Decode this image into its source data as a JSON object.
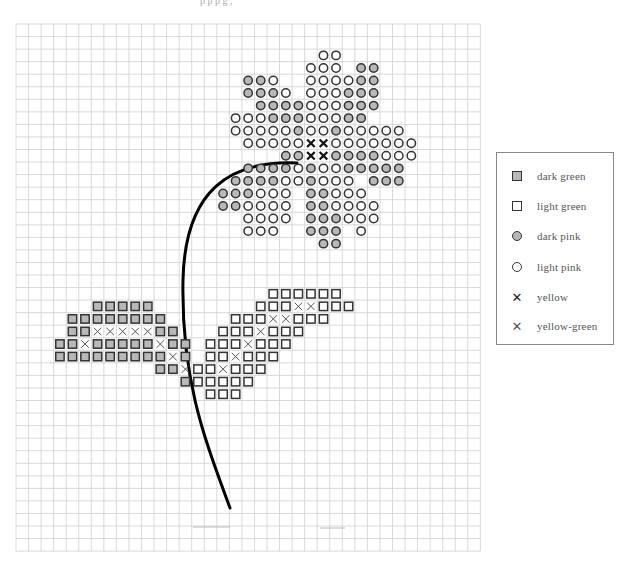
{
  "page": {
    "header_fragment": "p p p g ,"
  },
  "legend": {
    "items": [
      {
        "symbol": "square-dark",
        "label": "dark green"
      },
      {
        "symbol": "square-light",
        "label": "light green"
      },
      {
        "symbol": "circle-dark",
        "label": "dark pink"
      },
      {
        "symbol": "circle-light",
        "label": "light pink"
      },
      {
        "symbol": "x-bold",
        "label": "yellow"
      },
      {
        "symbol": "x-thin",
        "label": "yellow-green"
      }
    ]
  },
  "grid": {
    "x0": 16,
    "y0": 24,
    "cell": 12.55,
    "cols": 37,
    "rows": 42,
    "line_color": "#cfcfcf"
  },
  "colors": {
    "dark_fill": "#b8b8b8",
    "outline": "#333333",
    "stem": "#000000"
  },
  "stem": {
    "path": "M297,163 C230,160 185,190 183,280 C181,380 205,440 230,508"
  },
  "pattern": {
    "legend_codes": {
      "D": "dark pink circle",
      "L": "light pink circle",
      "Y": "yellow x",
      "G": "dark green square",
      "g": "light green square",
      "y": "yellow-green x"
    },
    "cells": [
      [
        2,
        24,
        "L"
      ],
      [
        2,
        25,
        "L"
      ],
      [
        3,
        23,
        "L"
      ],
      [
        3,
        24,
        "L"
      ],
      [
        3,
        25,
        "L"
      ],
      [
        3,
        27,
        "D"
      ],
      [
        3,
        28,
        "D"
      ],
      [
        4,
        18,
        "D"
      ],
      [
        4,
        19,
        "D"
      ],
      [
        4,
        20,
        "L"
      ],
      [
        4,
        23,
        "L"
      ],
      [
        4,
        24,
        "L"
      ],
      [
        4,
        25,
        "L"
      ],
      [
        4,
        26,
        "L"
      ],
      [
        4,
        27,
        "D"
      ],
      [
        4,
        28,
        "D"
      ],
      [
        5,
        18,
        "D"
      ],
      [
        5,
        19,
        "D"
      ],
      [
        5,
        20,
        "D"
      ],
      [
        5,
        21,
        "L"
      ],
      [
        5,
        23,
        "L"
      ],
      [
        5,
        24,
        "L"
      ],
      [
        5,
        25,
        "L"
      ],
      [
        5,
        26,
        "D"
      ],
      [
        5,
        27,
        "D"
      ],
      [
        5,
        28,
        "D"
      ],
      [
        6,
        19,
        "D"
      ],
      [
        6,
        20,
        "D"
      ],
      [
        6,
        21,
        "D"
      ],
      [
        6,
        22,
        "D"
      ],
      [
        6,
        23,
        "L"
      ],
      [
        6,
        24,
        "L"
      ],
      [
        6,
        25,
        "L"
      ],
      [
        6,
        26,
        "D"
      ],
      [
        6,
        27,
        "D"
      ],
      [
        6,
        28,
        "D"
      ],
      [
        7,
        17,
        "L"
      ],
      [
        7,
        18,
        "L"
      ],
      [
        7,
        19,
        "L"
      ],
      [
        7,
        20,
        "D"
      ],
      [
        7,
        21,
        "D"
      ],
      [
        7,
        22,
        "D"
      ],
      [
        7,
        23,
        "L"
      ],
      [
        7,
        24,
        "L"
      ],
      [
        7,
        25,
        "L"
      ],
      [
        7,
        26,
        "D"
      ],
      [
        7,
        27,
        "D"
      ],
      [
        8,
        17,
        "L"
      ],
      [
        8,
        18,
        "L"
      ],
      [
        8,
        19,
        "L"
      ],
      [
        8,
        20,
        "L"
      ],
      [
        8,
        21,
        "L"
      ],
      [
        8,
        22,
        "D"
      ],
      [
        8,
        23,
        "L"
      ],
      [
        8,
        24,
        "L"
      ],
      [
        8,
        25,
        "D"
      ],
      [
        8,
        26,
        "L"
      ],
      [
        8,
        27,
        "L"
      ],
      [
        8,
        28,
        "L"
      ],
      [
        8,
        29,
        "L"
      ],
      [
        8,
        30,
        "L"
      ],
      [
        9,
        18,
        "L"
      ],
      [
        9,
        19,
        "L"
      ],
      [
        9,
        20,
        "L"
      ],
      [
        9,
        21,
        "L"
      ],
      [
        9,
        22,
        "L"
      ],
      [
        9,
        23,
        "Y"
      ],
      [
        9,
        24,
        "Y"
      ],
      [
        9,
        25,
        "L"
      ],
      [
        9,
        26,
        "L"
      ],
      [
        9,
        27,
        "L"
      ],
      [
        9,
        28,
        "L"
      ],
      [
        9,
        29,
        "L"
      ],
      [
        9,
        30,
        "L"
      ],
      [
        9,
        31,
        "L"
      ],
      [
        10,
        21,
        "D"
      ],
      [
        10,
        22,
        "D"
      ],
      [
        10,
        23,
        "Y"
      ],
      [
        10,
        24,
        "Y"
      ],
      [
        10,
        25,
        "D"
      ],
      [
        10,
        26,
        "D"
      ],
      [
        10,
        27,
        "D"
      ],
      [
        10,
        28,
        "D"
      ],
      [
        10,
        29,
        "L"
      ],
      [
        10,
        30,
        "L"
      ],
      [
        10,
        31,
        "L"
      ],
      [
        11,
        18,
        "D"
      ],
      [
        11,
        19,
        "D"
      ],
      [
        11,
        20,
        "D"
      ],
      [
        11,
        21,
        "D"
      ],
      [
        11,
        22,
        "L"
      ],
      [
        11,
        23,
        "D"
      ],
      [
        11,
        24,
        "L"
      ],
      [
        11,
        25,
        "L"
      ],
      [
        11,
        26,
        "D"
      ],
      [
        11,
        27,
        "D"
      ],
      [
        11,
        28,
        "D"
      ],
      [
        11,
        29,
        "D"
      ],
      [
        11,
        30,
        "D"
      ],
      [
        12,
        17,
        "D"
      ],
      [
        12,
        18,
        "D"
      ],
      [
        12,
        19,
        "D"
      ],
      [
        12,
        20,
        "D"
      ],
      [
        12,
        21,
        "L"
      ],
      [
        12,
        22,
        "L"
      ],
      [
        12,
        23,
        "D"
      ],
      [
        12,
        24,
        "L"
      ],
      [
        12,
        25,
        "L"
      ],
      [
        12,
        26,
        "L"
      ],
      [
        12,
        28,
        "D"
      ],
      [
        12,
        29,
        "D"
      ],
      [
        12,
        30,
        "D"
      ],
      [
        13,
        16,
        "D"
      ],
      [
        13,
        17,
        "D"
      ],
      [
        13,
        18,
        "D"
      ],
      [
        13,
        19,
        "L"
      ],
      [
        13,
        20,
        "L"
      ],
      [
        13,
        21,
        "L"
      ],
      [
        13,
        23,
        "D"
      ],
      [
        13,
        24,
        "D"
      ],
      [
        13,
        25,
        "L"
      ],
      [
        13,
        26,
        "L"
      ],
      [
        13,
        27,
        "L"
      ],
      [
        14,
        16,
        "D"
      ],
      [
        14,
        17,
        "D"
      ],
      [
        14,
        18,
        "L"
      ],
      [
        14,
        19,
        "L"
      ],
      [
        14,
        20,
        "L"
      ],
      [
        14,
        21,
        "L"
      ],
      [
        14,
        23,
        "D"
      ],
      [
        14,
        24,
        "D"
      ],
      [
        14,
        25,
        "L"
      ],
      [
        14,
        26,
        "L"
      ],
      [
        14,
        27,
        "L"
      ],
      [
        14,
        28,
        "L"
      ],
      [
        15,
        18,
        "L"
      ],
      [
        15,
        19,
        "L"
      ],
      [
        15,
        20,
        "L"
      ],
      [
        15,
        21,
        "L"
      ],
      [
        15,
        23,
        "D"
      ],
      [
        15,
        24,
        "D"
      ],
      [
        15,
        25,
        "D"
      ],
      [
        15,
        26,
        "L"
      ],
      [
        15,
        27,
        "L"
      ],
      [
        15,
        28,
        "L"
      ],
      [
        16,
        18,
        "L"
      ],
      [
        16,
        19,
        "L"
      ],
      [
        16,
        20,
        "L"
      ],
      [
        16,
        23,
        "D"
      ],
      [
        16,
        24,
        "D"
      ],
      [
        16,
        25,
        "D"
      ],
      [
        16,
        27,
        "L"
      ],
      [
        17,
        24,
        "D"
      ],
      [
        17,
        25,
        "D"
      ],
      [
        21,
        20,
        "g"
      ],
      [
        21,
        21,
        "g"
      ],
      [
        21,
        22,
        "g"
      ],
      [
        21,
        23,
        "g"
      ],
      [
        21,
        24,
        "g"
      ],
      [
        21,
        25,
        "g"
      ],
      [
        22,
        19,
        "g"
      ],
      [
        22,
        20,
        "g"
      ],
      [
        22,
        21,
        "g"
      ],
      [
        22,
        22,
        "y"
      ],
      [
        22,
        23,
        "y"
      ],
      [
        22,
        24,
        "g"
      ],
      [
        22,
        25,
        "g"
      ],
      [
        22,
        26,
        "g"
      ],
      [
        23,
        17,
        "g"
      ],
      [
        23,
        18,
        "g"
      ],
      [
        23,
        19,
        "g"
      ],
      [
        23,
        20,
        "y"
      ],
      [
        23,
        21,
        "y"
      ],
      [
        23,
        22,
        "g"
      ],
      [
        23,
        23,
        "g"
      ],
      [
        23,
        24,
        "g"
      ],
      [
        24,
        16,
        "g"
      ],
      [
        24,
        17,
        "g"
      ],
      [
        24,
        18,
        "g"
      ],
      [
        24,
        19,
        "y"
      ],
      [
        24,
        20,
        "g"
      ],
      [
        24,
        21,
        "g"
      ],
      [
        24,
        22,
        "g"
      ],
      [
        25,
        15,
        "g"
      ],
      [
        25,
        16,
        "g"
      ],
      [
        25,
        17,
        "g"
      ],
      [
        25,
        18,
        "y"
      ],
      [
        25,
        19,
        "g"
      ],
      [
        25,
        20,
        "g"
      ],
      [
        25,
        21,
        "g"
      ],
      [
        26,
        15,
        "g"
      ],
      [
        26,
        16,
        "g"
      ],
      [
        26,
        17,
        "y"
      ],
      [
        26,
        18,
        "g"
      ],
      [
        26,
        19,
        "g"
      ],
      [
        26,
        20,
        "g"
      ],
      [
        27,
        14,
        "g"
      ],
      [
        27,
        15,
        "g"
      ],
      [
        27,
        16,
        "y"
      ],
      [
        27,
        17,
        "g"
      ],
      [
        27,
        18,
        "g"
      ],
      [
        27,
        19,
        "g"
      ],
      [
        28,
        14,
        "g"
      ],
      [
        28,
        15,
        "g"
      ],
      [
        28,
        16,
        "g"
      ],
      [
        28,
        17,
        "g"
      ],
      [
        28,
        18,
        "g"
      ],
      [
        29,
        15,
        "g"
      ],
      [
        29,
        16,
        "g"
      ],
      [
        29,
        17,
        "g"
      ],
      [
        22,
        6,
        "G"
      ],
      [
        22,
        7,
        "G"
      ],
      [
        22,
        8,
        "G"
      ],
      [
        22,
        9,
        "G"
      ],
      [
        22,
        10,
        "G"
      ],
      [
        23,
        4,
        "G"
      ],
      [
        23,
        5,
        "G"
      ],
      [
        23,
        6,
        "G"
      ],
      [
        23,
        7,
        "G"
      ],
      [
        23,
        8,
        "G"
      ],
      [
        23,
        9,
        "G"
      ],
      [
        23,
        10,
        "G"
      ],
      [
        23,
        11,
        "G"
      ],
      [
        24,
        4,
        "G"
      ],
      [
        24,
        5,
        "G"
      ],
      [
        24,
        6,
        "y"
      ],
      [
        24,
        7,
        "y"
      ],
      [
        24,
        8,
        "y"
      ],
      [
        24,
        9,
        "y"
      ],
      [
        24,
        10,
        "y"
      ],
      [
        24,
        11,
        "G"
      ],
      [
        24,
        12,
        "G"
      ],
      [
        25,
        3,
        "G"
      ],
      [
        25,
        4,
        "G"
      ],
      [
        25,
        5,
        "y"
      ],
      [
        25,
        6,
        "G"
      ],
      [
        25,
        7,
        "G"
      ],
      [
        25,
        8,
        "G"
      ],
      [
        25,
        9,
        "G"
      ],
      [
        25,
        10,
        "G"
      ],
      [
        25,
        11,
        "y"
      ],
      [
        25,
        12,
        "G"
      ],
      [
        25,
        13,
        "G"
      ],
      [
        26,
        3,
        "G"
      ],
      [
        26,
        4,
        "G"
      ],
      [
        26,
        5,
        "G"
      ],
      [
        26,
        6,
        "G"
      ],
      [
        26,
        7,
        "G"
      ],
      [
        26,
        8,
        "G"
      ],
      [
        26,
        9,
        "G"
      ],
      [
        26,
        10,
        "G"
      ],
      [
        26,
        11,
        "G"
      ],
      [
        26,
        12,
        "y"
      ],
      [
        26,
        13,
        "G"
      ],
      [
        27,
        11,
        "G"
      ],
      [
        27,
        12,
        "G"
      ],
      [
        27,
        13,
        "y"
      ],
      [
        28,
        13,
        "G"
      ]
    ]
  }
}
